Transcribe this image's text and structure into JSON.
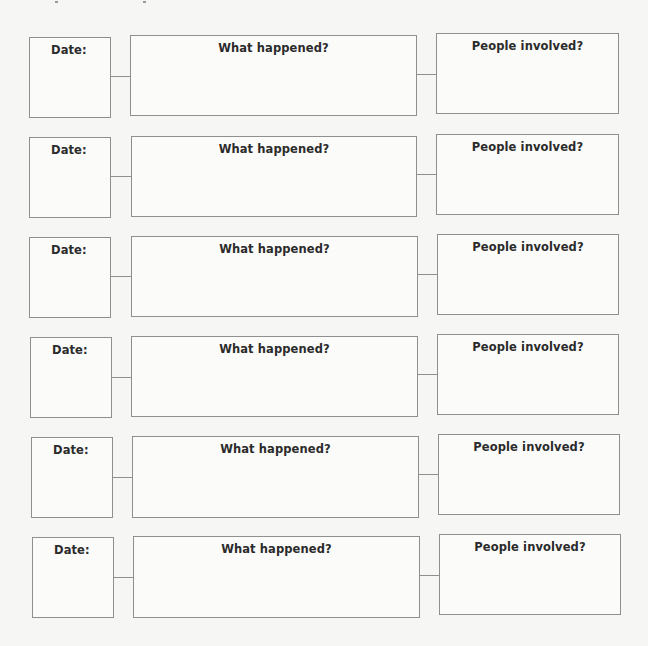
{
  "worksheet": {
    "rows": [
      {
        "date_label": "Date:",
        "what_label": "What happened?",
        "people_label": "People involved?",
        "date_value": "",
        "what_value": "",
        "people_value": ""
      },
      {
        "date_label": "Date:",
        "what_label": "What happened?",
        "people_label": "People involved?",
        "date_value": "",
        "what_value": "",
        "people_value": ""
      },
      {
        "date_label": "Date:",
        "what_label": "What happened?",
        "people_label": "People involved?",
        "date_value": "",
        "what_value": "",
        "people_value": ""
      },
      {
        "date_label": "Date:",
        "what_label": "What happened?",
        "people_label": "People involved?",
        "date_value": "",
        "what_value": "",
        "people_value": ""
      },
      {
        "date_label": "Date:",
        "what_label": "What happened?",
        "people_label": "People involved?",
        "date_value": "",
        "what_value": "",
        "people_value": ""
      },
      {
        "date_label": "Date:",
        "what_label": "What happened?",
        "people_label": "People involved?",
        "date_value": "",
        "what_value": "",
        "people_value": ""
      }
    ]
  },
  "colors": {
    "background": "#f6f6f4",
    "box_fill": "#fbfbfa",
    "border": "#8f8f8f",
    "text": "#2b2b2b"
  }
}
